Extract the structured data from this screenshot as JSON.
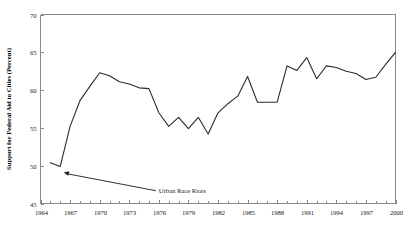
{
  "chart_data": {
    "type": "line",
    "title": "",
    "subtitle": "",
    "xlabel": "",
    "ylabel": "Support for Federal Aid to Cities (Percent)",
    "xlim": [
      1964,
      2000
    ],
    "ylim": [
      45,
      70
    ],
    "grid": false,
    "legend": null,
    "legend_position": "none",
    "y_ticks": [
      45,
      50,
      55,
      60,
      65,
      70
    ],
    "y_tick_labels": [
      "45",
      "50",
      "55",
      "60",
      "65",
      "70"
    ],
    "x_ticks": [
      1964,
      1967,
      1970,
      1973,
      1976,
      1979,
      1982,
      1985,
      1988,
      1991,
      1994,
      1997,
      2000
    ],
    "x_tick_labels": [
      "1964",
      "1967",
      "1970",
      "1973",
      "1976",
      "1979",
      "1982",
      "1985",
      "1988",
      "1991",
      "1994",
      "1997",
      "2000"
    ],
    "x_minor_tick_interval": 1,
    "series": [
      {
        "name": "Support for Federal Aid to Cities",
        "color": "#2b2b2b",
        "x": [
          1965,
          1966,
          1967,
          1968,
          1969,
          1970,
          1971,
          1972,
          1973,
          1974,
          1975,
          1976,
          1977,
          1978,
          1979,
          1980,
          1981,
          1982,
          1983,
          1984,
          1985,
          1986,
          1987,
          1988,
          1989,
          1990,
          1991,
          1992,
          1993,
          1994,
          1995,
          1996,
          1997,
          1998,
          1999,
          2000
        ],
        "values": [
          50.4,
          49.9,
          55.2,
          58.6,
          60.5,
          62.3,
          61.9,
          61.1,
          60.8,
          60.3,
          60.2,
          57.0,
          55.2,
          56.4,
          54.9,
          56.4,
          54.2,
          57.0,
          58.2,
          59.2,
          61.8,
          58.4,
          58.4,
          58.4,
          63.2,
          62.6,
          64.3,
          61.5,
          63.2,
          63.0,
          62.5,
          62.2,
          61.4,
          61.7,
          63.4,
          65.0
        ]
      }
    ],
    "annotations": [
      {
        "text": "Urban Race Riots",
        "points_to_x": 1966,
        "points_to_y": 49.9,
        "label_x": 1976,
        "label_y": 46.4
      }
    ]
  },
  "axis": {
    "y_axis_title": "Support for Federal Aid to Cities (Percent)"
  },
  "footer": {
    "partial_caption": ""
  }
}
